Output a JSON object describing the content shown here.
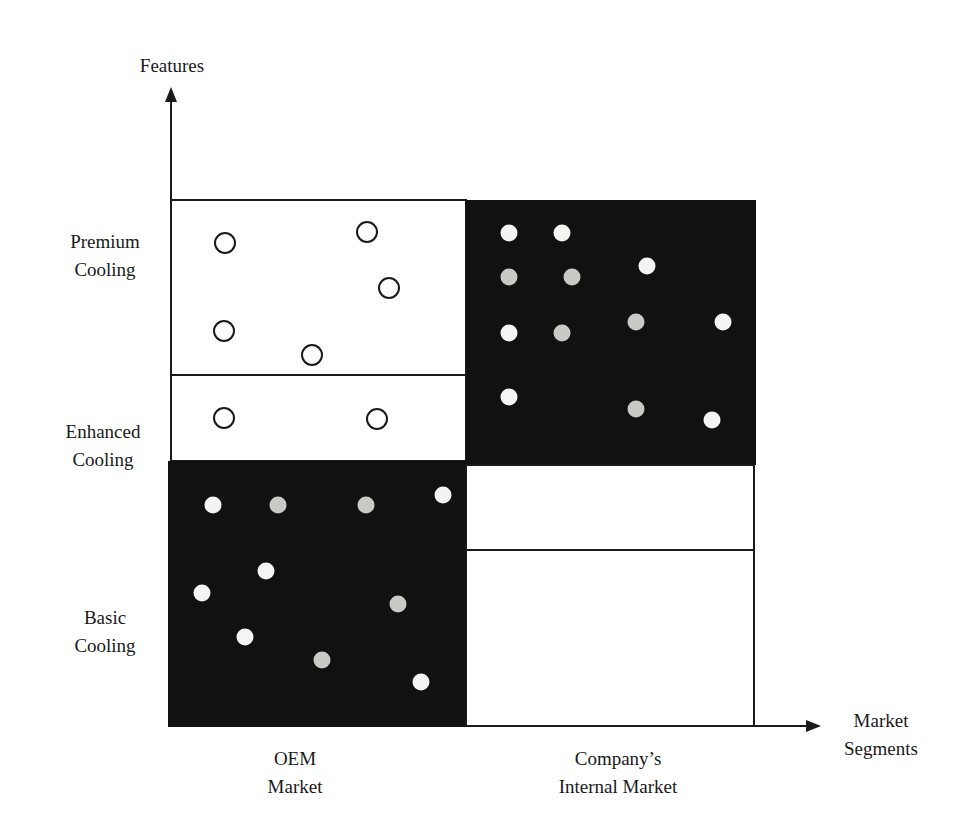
{
  "axes": {
    "y_label": "Features",
    "x_label_line1": "Market",
    "x_label_line2": "Segments"
  },
  "rows": [
    {
      "line1": "Premium",
      "line2": "Cooling"
    },
    {
      "line1": "Enhanced",
      "line2": "Cooling"
    },
    {
      "line1": "Basic",
      "line2": "Cooling"
    }
  ],
  "columns": [
    {
      "line1": "OEM",
      "line2": "Market"
    },
    {
      "line1": "Company’s",
      "line2": "Internal Market"
    }
  ],
  "colors": {
    "ink": "#1a1a1a",
    "filled_panel": "#111111",
    "dot_white": "#f4f4f2",
    "dot_grey": "#c9c9c6",
    "background": "#ffffff"
  },
  "chart_data": {
    "type": "scatter",
    "title": "",
    "xlabel": "Market Segments",
    "ylabel": "Features",
    "x_categories": [
      "OEM Market",
      "Company’s Internal Market"
    ],
    "y_categories": [
      "Basic Cooling",
      "Enhanced Cooling",
      "Premium Cooling"
    ],
    "panels": [
      {
        "name": "OEM Market – Premium & Enhanced Cooling",
        "fill": "white",
        "marker": "hollow circle",
        "points": [
          [
            225,
            243
          ],
          [
            367,
            232
          ],
          [
            389,
            288
          ],
          [
            224,
            331
          ],
          [
            312,
            355
          ],
          [
            224,
            418
          ],
          [
            377,
            419
          ]
        ]
      },
      {
        "name": "OEM Market – Basic Cooling",
        "fill": "black",
        "marker": "filled dot",
        "points": [
          [
            213,
            505
          ],
          [
            278,
            505
          ],
          [
            366,
            505
          ],
          [
            443,
            495
          ],
          [
            266,
            571
          ],
          [
            202,
            593
          ],
          [
            398,
            604
          ],
          [
            245,
            637
          ],
          [
            322,
            660
          ],
          [
            421,
            682
          ]
        ]
      },
      {
        "name": "Internal Market – Premium & Enhanced Cooling",
        "fill": "black",
        "marker": "filled dot",
        "points": [
          [
            509,
            233
          ],
          [
            562,
            233
          ],
          [
            647,
            266
          ],
          [
            509,
            277
          ],
          [
            572,
            277
          ],
          [
            509,
            333
          ],
          [
            562,
            333
          ],
          [
            636,
            322
          ],
          [
            723,
            322
          ],
          [
            509,
            397
          ],
          [
            636,
            409
          ],
          [
            712,
            420
          ]
        ]
      },
      {
        "name": "Internal Market – Enhanced Cooling (lower)",
        "fill": "white",
        "marker": "none",
        "points": []
      },
      {
        "name": "Internal Market – Basic Cooling",
        "fill": "white",
        "marker": "none",
        "points": []
      }
    ],
    "grid": false,
    "legend": null
  }
}
